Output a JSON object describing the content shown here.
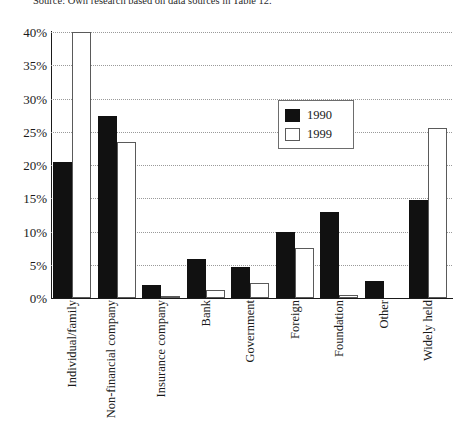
{
  "source_note": "Source: Own research based on data sources in Table 12.",
  "legend": {
    "position": "upper-right-inside",
    "entries": [
      {
        "label": "1990",
        "swatch": "filled-black-square",
        "color": "#111111"
      },
      {
        "label": "1999",
        "swatch": "outlined-white-square",
        "color": "#ffffff"
      }
    ]
  },
  "axes": {
    "y_ticks": [
      "40%",
      "35%",
      "30%",
      "25%",
      "20%",
      "15%",
      "10%",
      "5%",
      "0%"
    ],
    "y_min": 0,
    "y_max": 40,
    "y_step": 5
  },
  "chart_data": {
    "type": "bar",
    "title": "",
    "subtitle": "",
    "xlabel": "",
    "ylabel": "",
    "ylim": [
      0,
      40
    ],
    "ytick_step": 5,
    "ytick_format": "percent",
    "grid": "horizontal-dotted",
    "legend_position": "upper-right-inside",
    "categories": [
      "Individual/family",
      "Non-financial company",
      "Insurance company",
      "Bank",
      "Government",
      "Foreign",
      "Foundation",
      "Other",
      "Widely held"
    ],
    "series": [
      {
        "name": "1990",
        "color": "#111111",
        "values": [
          20.5,
          27.3,
          2.0,
          5.8,
          4.7,
          10.0,
          12.9,
          2.5,
          14.7
        ]
      },
      {
        "name": "1999",
        "color": "#ffffff",
        "values": [
          40.0,
          23.5,
          0.3,
          1.2,
          2.3,
          7.5,
          0.4,
          0.0,
          25.5
        ]
      }
    ],
    "annotations": []
  }
}
